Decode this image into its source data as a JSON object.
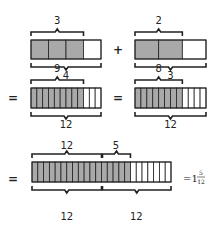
{
  "colors": {
    "shaded": "#a9a9a9",
    "empty": "#ffffff",
    "stroke": "#222222"
  },
  "rows": [
    {
      "bars": [
        {
          "parts": 4,
          "shaded": 3,
          "top_label": "3",
          "bottom_label": "4"
        },
        {
          "parts": 3,
          "shaded": 2,
          "top_label": "2",
          "bottom_label": "3"
        }
      ],
      "operator_between": "+"
    },
    {
      "prefix": "=",
      "bars": [
        {
          "parts": 12,
          "shaded": 9,
          "top_label": "9",
          "bottom_label": "12"
        },
        {
          "parts": 12,
          "shaded": 8,
          "top_label": "8",
          "bottom_label": "12"
        }
      ],
      "operator_between": "="
    },
    {
      "prefix": "=",
      "bar": {
        "parts": 24,
        "shaded": 17
      },
      "top_labels": [
        "12",
        "5"
      ],
      "bottom_labels": [
        "12",
        "12"
      ],
      "result": {
        "whole": "=1",
        "numerator": "5",
        "denominator": "12"
      }
    }
  ]
}
